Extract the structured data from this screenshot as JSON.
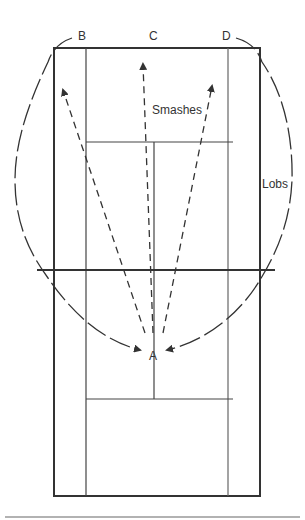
{
  "diagram": {
    "labels": {
      "a": "A",
      "b": "B",
      "c": "C",
      "d": "D",
      "smashes": "Smashes",
      "lobs": "Lobs"
    },
    "colors": {
      "court_line": "#333333",
      "arrow": "#333333",
      "rule": "#999999"
    }
  }
}
